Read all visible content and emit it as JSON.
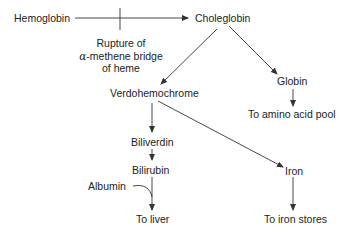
{
  "diagram": {
    "nodes": {
      "hemoglobin": "Hemoglobin",
      "choleglobin": "Choleglobin",
      "verdohemochrome": "Verdohemochrome",
      "globin": "Globin",
      "amino_acid_pool": "To amino acid pool",
      "biliverdin": "Biliverdin",
      "bilirubin": "Bilirubin",
      "albumin": "Albumin",
      "liver": "To liver",
      "iron": "Iron",
      "iron_stores": "To iron stores"
    },
    "annotation": {
      "line1": "Rupture of",
      "alpha": "α",
      "line2_rest": "-methene bridge",
      "line3": "of heme"
    },
    "edges": [
      {
        "from": "Hemoglobin",
        "to": "Choleglobin",
        "label": "Rupture of α-methene bridge of heme"
      },
      {
        "from": "Choleglobin",
        "to": "Verdohemochrome"
      },
      {
        "from": "Choleglobin",
        "to": "Globin"
      },
      {
        "from": "Globin",
        "to": "To amino acid pool"
      },
      {
        "from": "Verdohemochrome",
        "to": "Biliverdin"
      },
      {
        "from": "Verdohemochrome",
        "to": "Iron"
      },
      {
        "from": "Biliverdin",
        "to": "Bilirubin"
      },
      {
        "from": "Bilirubin",
        "to": "To liver",
        "joined_by": "Albumin"
      },
      {
        "from": "Iron",
        "to": "To iron stores"
      }
    ]
  }
}
